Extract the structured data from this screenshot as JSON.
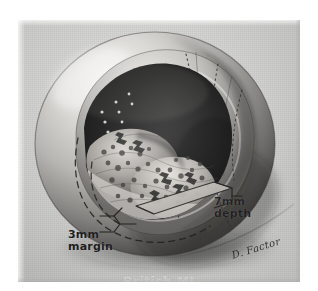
{
  "figure": {
    "kind": "medical-illustration",
    "medium": "grayscale airbrush drawing, scanned halftone photograph"
  },
  "annotations": {
    "depth": "7mm\ndepth",
    "margin": "3mm\nmargin",
    "depth_value": "7mm",
    "depth_label": "depth",
    "margin_value": "3mm",
    "margin_label": "margin"
  },
  "signature": "D. Factor",
  "watermark": "British MJ",
  "colors": {
    "page_background": "#ffffff",
    "panel_light": "#d8d8d6",
    "panel_mid": "#c9c9c7",
    "sphere_highlight": "#efedea",
    "sphere_midtone": "#a9a7a4",
    "sphere_shadow": "#4a4846",
    "cavity_dark": "#0c0c0c",
    "cavity_deep": "#050505",
    "tumor_light": "#cfcdc8",
    "tumor_mid": "#8e8c88",
    "ink": "#141414"
  },
  "guide_lines": {
    "margin_arc_style": "dashed",
    "hidden_contour_style": "dotted",
    "depth_bracket_style": "solid-parallelogram-wedge"
  }
}
